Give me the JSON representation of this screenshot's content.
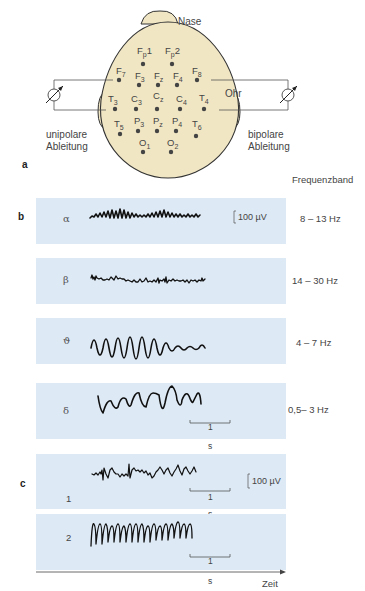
{
  "part_a": {
    "label": "a",
    "nose_label": "Nase",
    "ear_label": "Ohr",
    "left_caption": [
      "unipolare",
      "Ableitung"
    ],
    "right_caption": [
      "bipolare",
      "Ableitung"
    ],
    "electrodes": [
      {
        "id": "Fp1",
        "main": "F",
        "sub": "p",
        "suffix": "1"
      },
      {
        "id": "Fp2",
        "main": "F",
        "sub": "p",
        "suffix": "2"
      },
      {
        "id": "F7",
        "main": "F",
        "sub": "7"
      },
      {
        "id": "F3",
        "main": "F",
        "sub": "3"
      },
      {
        "id": "Fz",
        "main": "F",
        "sub": "z"
      },
      {
        "id": "F4",
        "main": "F",
        "sub": "4"
      },
      {
        "id": "F8",
        "main": "F",
        "sub": "8"
      },
      {
        "id": "T3",
        "main": "T",
        "sub": "3"
      },
      {
        "id": "C3",
        "main": "C",
        "sub": "3"
      },
      {
        "id": "Cz",
        "main": "C",
        "sub": "z"
      },
      {
        "id": "C4",
        "main": "C",
        "sub": "4"
      },
      {
        "id": "T4",
        "main": "T",
        "sub": "4"
      },
      {
        "id": "T5",
        "main": "T",
        "sub": "5"
      },
      {
        "id": "P3",
        "main": "P",
        "sub": "3"
      },
      {
        "id": "Pz",
        "main": "P",
        "sub": "z"
      },
      {
        "id": "P4",
        "main": "P",
        "sub": "4"
      },
      {
        "id": "T6",
        "main": "T",
        "sub": "6"
      },
      {
        "id": "O1",
        "main": "O",
        "sub": "1"
      },
      {
        "id": "O2",
        "main": "O",
        "sub": "2"
      }
    ]
  },
  "part_b": {
    "label": "b",
    "column_header": "Frequenzband",
    "scale_amplitude": "100 µV",
    "scale_time_value": "1",
    "scale_time_unit": "s",
    "bands": [
      {
        "symbol": "α",
        "name": "alpha",
        "range": "8 – 13 Hz"
      },
      {
        "symbol": "β",
        "name": "beta",
        "range": "14 – 30 Hz"
      },
      {
        "symbol": "ϑ",
        "name": "theta",
        "range": "4 – 7 Hz"
      },
      {
        "symbol": "δ",
        "name": "delta",
        "range": "0,5– 3 Hz"
      }
    ]
  },
  "part_c": {
    "label": "c",
    "scale_amplitude": "100 µV",
    "traces": [
      {
        "number": "1",
        "scale_time_value": "1",
        "scale_time_unit": "s"
      },
      {
        "number": "2",
        "scale_time_value": "1",
        "scale_time_unit": "s"
      }
    ],
    "time_axis_label": "Zeit"
  },
  "colors": {
    "head_fill": "#f0e6c4",
    "panel_bg": "#dde9f5",
    "trace": "#111111"
  }
}
